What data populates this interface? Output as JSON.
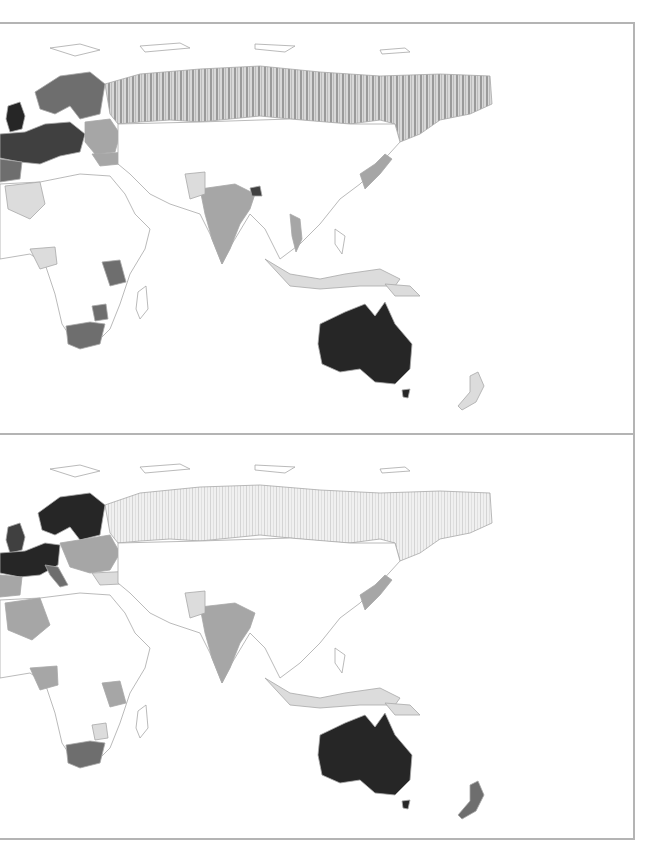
{
  "figure": {
    "type": "choropleth-map-pair",
    "region_shown": "Europe, Africa, Asia, Oceania (western hemisphere cropped off)",
    "colormap": "grayscale",
    "panels": [
      {
        "id": "top",
        "fills": {
          "australia": "#262626",
          "russia": "#b0b0b0",
          "uk": "#262626",
          "scandinavia": "#5a5a5a",
          "western_europe": "#4a4a4a",
          "eastern_europe": "#8a8a8a",
          "india": "#a0a0a0",
          "bangladesh": "#404040",
          "pakistan": "#dcdcdc",
          "south_africa": "#6e6e6e",
          "tanzania": "#6e6e6e",
          "zimbabwe": "#6e6e6e",
          "nigeria": "#dcdcdc",
          "algeria": "#dcdcdc",
          "japan": "#8a8a8a",
          "vietnam": "#a0a0a0",
          "indonesia": "#dcdcdc",
          "new_zealand": "#dcdcdc"
        }
      },
      {
        "id": "bottom",
        "fills": {
          "australia": "#262626",
          "russia": "#e4e4e4",
          "uk": "#404040",
          "scandinavia": "#303030",
          "france_germany": "#303030",
          "italy": "#6e6e6e",
          "eastern_europe": "#a6a6a6",
          "turkey": "#dcdcdc",
          "india": "#a0a0a0",
          "pakistan": "#dcdcdc",
          "south_africa": "#6e6e6e",
          "tanzania": "#a6a6a6",
          "zimbabwe": "#dcdcdc",
          "nigeria": "#a6a6a6",
          "algeria": "#a6a6a6",
          "japan": "#8a8a8a",
          "indonesia": "#dcdcdc",
          "new_zealand": "#6e6e6e"
        }
      }
    ]
  }
}
